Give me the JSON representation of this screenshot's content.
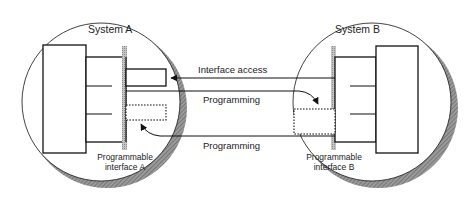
{
  "diagram": {
    "system_a": {
      "title": "System A",
      "interface_label_line1": "Programmable",
      "interface_label_line2": "interface A"
    },
    "system_b": {
      "title": "System B",
      "interface_label_line1": "Programmable",
      "interface_label_line2": "interface B"
    },
    "edges": [
      {
        "label": "Interface access",
        "from": "System B",
        "to": "System A"
      },
      {
        "label": "Programming",
        "from": "System A",
        "to": "System B"
      },
      {
        "label": "Programming",
        "from": "System B",
        "to": "System A"
      }
    ],
    "colors": {
      "stroke": "#111111",
      "shadow": "#8a8a8a",
      "interface_bar": "#b5b5b5"
    }
  }
}
